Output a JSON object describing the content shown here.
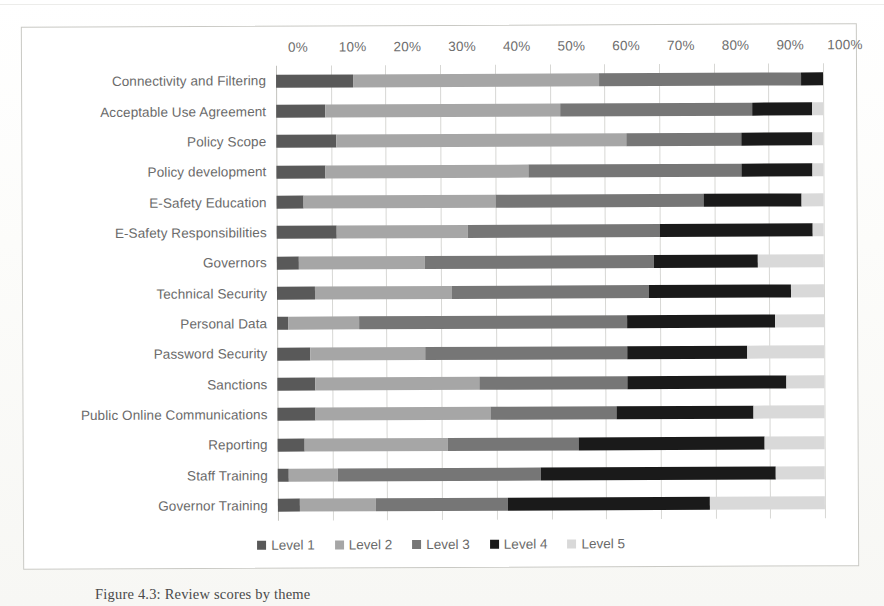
{
  "figure": {
    "caption": "Figure 4.3: Review scores by theme",
    "frame_color": "#c9c9c4"
  },
  "legend": {
    "position": "bottom-center",
    "items": [
      {
        "label": "Level 1",
        "color": "#595959"
      },
      {
        "label": "Level 2",
        "color": "#a6a6a6"
      },
      {
        "label": "Level 3",
        "color": "#767676"
      },
      {
        "label": "Level 4",
        "color": "#1a1a1a"
      },
      {
        "label": "Level 5",
        "color": "#d9d9d9"
      }
    ]
  },
  "axis": {
    "tick_labels": [
      "0%",
      "10%",
      "20%",
      "30%",
      "40%",
      "50%",
      "60%",
      "70%",
      "80%",
      "90%",
      "100%"
    ]
  },
  "chart_data": {
    "type": "bar",
    "orientation": "horizontal",
    "stacked": true,
    "normalized": true,
    "title": "",
    "xlabel": "",
    "ylabel": "",
    "xlim": [
      0,
      100
    ],
    "xticks": [
      0,
      10,
      20,
      30,
      40,
      50,
      60,
      70,
      80,
      90,
      100
    ],
    "grid": "vertical",
    "legend_position": "bottom-center",
    "categories": [
      "Connectivity and Filtering",
      "Acceptable Use Agreement",
      "Policy Scope",
      "Policy development",
      "E-Safety Education",
      "E-Safety Responsibilities",
      "Governors",
      "Technical Security",
      "Personal Data",
      "Password Security",
      "Sanctions",
      "Public Online Communications",
      "Reporting",
      "Staff Training",
      "Governor Training"
    ],
    "series": [
      {
        "name": "Level 1",
        "color": "#595959",
        "values": [
          14,
          9,
          11,
          9,
          5,
          11,
          4,
          7,
          2,
          6,
          7,
          7,
          5,
          2,
          4
        ]
      },
      {
        "name": "Level 2",
        "color": "#a6a6a6",
        "values": [
          45,
          43,
          53,
          37,
          35,
          24,
          23,
          25,
          13,
          21,
          30,
          32,
          26,
          9,
          14
        ]
      },
      {
        "name": "Level 3",
        "color": "#767676",
        "values": [
          37,
          35,
          21,
          39,
          38,
          35,
          42,
          36,
          49,
          37,
          27,
          23,
          24,
          37,
          24
        ]
      },
      {
        "name": "Level 4",
        "color": "#1a1a1a",
        "values": [
          4,
          11,
          13,
          13,
          18,
          28,
          19,
          26,
          27,
          22,
          29,
          25,
          34,
          43,
          37
        ]
      },
      {
        "name": "Level 5",
        "color": "#d9d9d9",
        "values": [
          0,
          2,
          2,
          2,
          4,
          2,
          12,
          6,
          9,
          14,
          7,
          13,
          11,
          9,
          21
        ]
      }
    ]
  }
}
